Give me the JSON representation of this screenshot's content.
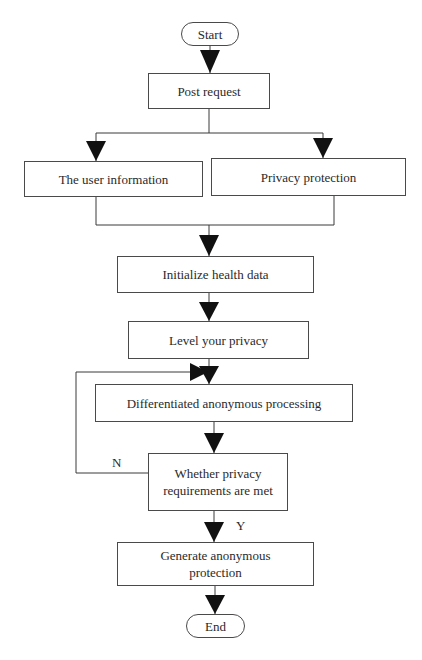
{
  "diagram": {
    "type": "flowchart",
    "nodes": {
      "start": "Start",
      "post_request": "Post request",
      "user_information": "The user information",
      "privacy_protection": "Privacy protection",
      "initialize_health_data": "Initialize health data",
      "level_privacy": "Level your privacy",
      "differentiated_processing": "Differentiated anonymous processing",
      "decision": "Whether privacy requirements are met",
      "generate_protection": "Generate anonymous protection",
      "end": "End"
    },
    "edge_labels": {
      "no": "N",
      "yes": "Y"
    },
    "colors": {
      "line": "#3a3a3a",
      "arrow": "#111111",
      "text": "#2a2a2a",
      "background": "#ffffff"
    }
  }
}
